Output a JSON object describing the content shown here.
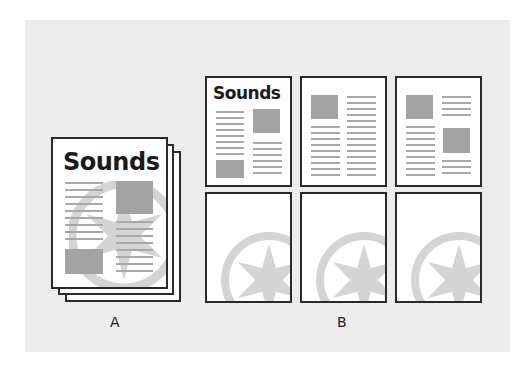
{
  "figure": {
    "background_color": "#ececec",
    "page_border_color": "#2a2a2a",
    "placeholder_gray": "#a3a3a3",
    "watermark_gray": "#d4d4d4"
  },
  "stack_a": {
    "label": "A",
    "page_title": "Sounds",
    "description": "Stacked multi-page document with wheel watermark behind content"
  },
  "grid_b": {
    "label": "B",
    "top_row": [
      {
        "title": "Sounds",
        "layout": "title-image-right-image-bottom-left"
      },
      {
        "title": "",
        "layout": "image-top-left-text"
      },
      {
        "title": "",
        "layout": "image-top-left-image-right"
      }
    ],
    "bottom_row": [
      {
        "layout": "wheel-watermark"
      },
      {
        "layout": "wheel-watermark"
      },
      {
        "layout": "wheel-watermark"
      }
    ]
  }
}
